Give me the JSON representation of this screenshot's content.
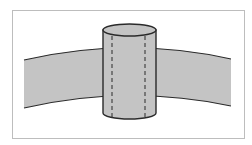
{
  "diagram": {
    "colors": {
      "fill": "#c4c4c4",
      "stroke": "#2a2a2a",
      "frame": "#bdbdbd",
      "background": "#ffffff"
    },
    "elements": [
      {
        "id": "band",
        "type": "curved-band"
      },
      {
        "id": "cylinder",
        "type": "cylinder",
        "dashed_lines": 2
      }
    ]
  }
}
